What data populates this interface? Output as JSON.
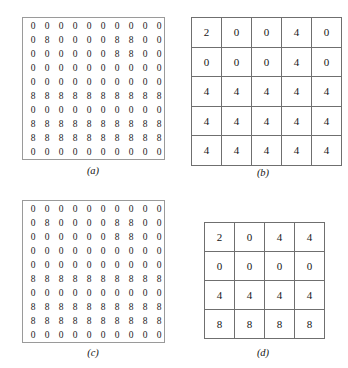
{
  "figure": {
    "panels": [
      {
        "id": "a",
        "caption": "(a)",
        "kind": "dense",
        "rows": 10,
        "cols": 10,
        "partition_offset": 0,
        "partition_size": 2,
        "values": [
          [
            0,
            0,
            0,
            0,
            0,
            0,
            0,
            0,
            0,
            0
          ],
          [
            0,
            8,
            0,
            0,
            0,
            0,
            8,
            8,
            0,
            0
          ],
          [
            0,
            0,
            0,
            0,
            0,
            0,
            8,
            8,
            0,
            0
          ],
          [
            0,
            0,
            0,
            0,
            0,
            0,
            0,
            0,
            0,
            0
          ],
          [
            0,
            0,
            0,
            0,
            0,
            0,
            0,
            0,
            0,
            0
          ],
          [
            8,
            8,
            8,
            8,
            8,
            8,
            8,
            8,
            8,
            8
          ],
          [
            0,
            0,
            0,
            0,
            0,
            0,
            0,
            0,
            0,
            0
          ],
          [
            8,
            8,
            8,
            8,
            8,
            8,
            8,
            8,
            8,
            8
          ],
          [
            8,
            8,
            8,
            8,
            8,
            8,
            8,
            8,
            8,
            8
          ],
          [
            0,
            0,
            0,
            0,
            0,
            0,
            0,
            0,
            0,
            0
          ]
        ]
      },
      {
        "id": "b",
        "caption": "(b)",
        "kind": "sparse",
        "rows": 5,
        "cols": 5,
        "values": [
          [
            2,
            0,
            0,
            4,
            0
          ],
          [
            0,
            0,
            0,
            4,
            0
          ],
          [
            4,
            4,
            4,
            4,
            4
          ],
          [
            4,
            4,
            4,
            4,
            4
          ],
          [
            4,
            4,
            4,
            4,
            4
          ]
        ]
      },
      {
        "id": "c",
        "caption": "(c)",
        "kind": "dense",
        "rows": 10,
        "cols": 10,
        "partition_offset": 1,
        "partition_size": 2,
        "values": [
          [
            0,
            0,
            0,
            0,
            0,
            0,
            0,
            0,
            0,
            0
          ],
          [
            0,
            8,
            0,
            0,
            0,
            0,
            8,
            8,
            0,
            0
          ],
          [
            0,
            0,
            0,
            0,
            0,
            0,
            8,
            8,
            0,
            0
          ],
          [
            0,
            0,
            0,
            0,
            0,
            0,
            0,
            0,
            0,
            0
          ],
          [
            0,
            0,
            0,
            0,
            0,
            0,
            0,
            0,
            0,
            0
          ],
          [
            8,
            8,
            8,
            8,
            8,
            8,
            8,
            8,
            8,
            8
          ],
          [
            0,
            0,
            0,
            0,
            0,
            0,
            0,
            0,
            0,
            0
          ],
          [
            8,
            8,
            8,
            8,
            8,
            8,
            8,
            8,
            8,
            8
          ],
          [
            8,
            8,
            8,
            8,
            8,
            8,
            8,
            8,
            8,
            8
          ],
          [
            0,
            0,
            0,
            0,
            0,
            0,
            0,
            0,
            0,
            0
          ]
        ]
      },
      {
        "id": "d",
        "caption": "(d)",
        "kind": "sparse",
        "rows": 4,
        "cols": 4,
        "values": [
          [
            2,
            0,
            4,
            4
          ],
          [
            0,
            0,
            0,
            0
          ],
          [
            4,
            4,
            4,
            4
          ],
          [
            8,
            8,
            8,
            8
          ]
        ]
      }
    ]
  },
  "colors": {
    "page_background": "#ffffff",
    "text": "#1a1a1a",
    "dense_border": "#9a9a9a",
    "dashed_partition": "#8d8d8d",
    "sparse_border": "#6f6f6f"
  }
}
